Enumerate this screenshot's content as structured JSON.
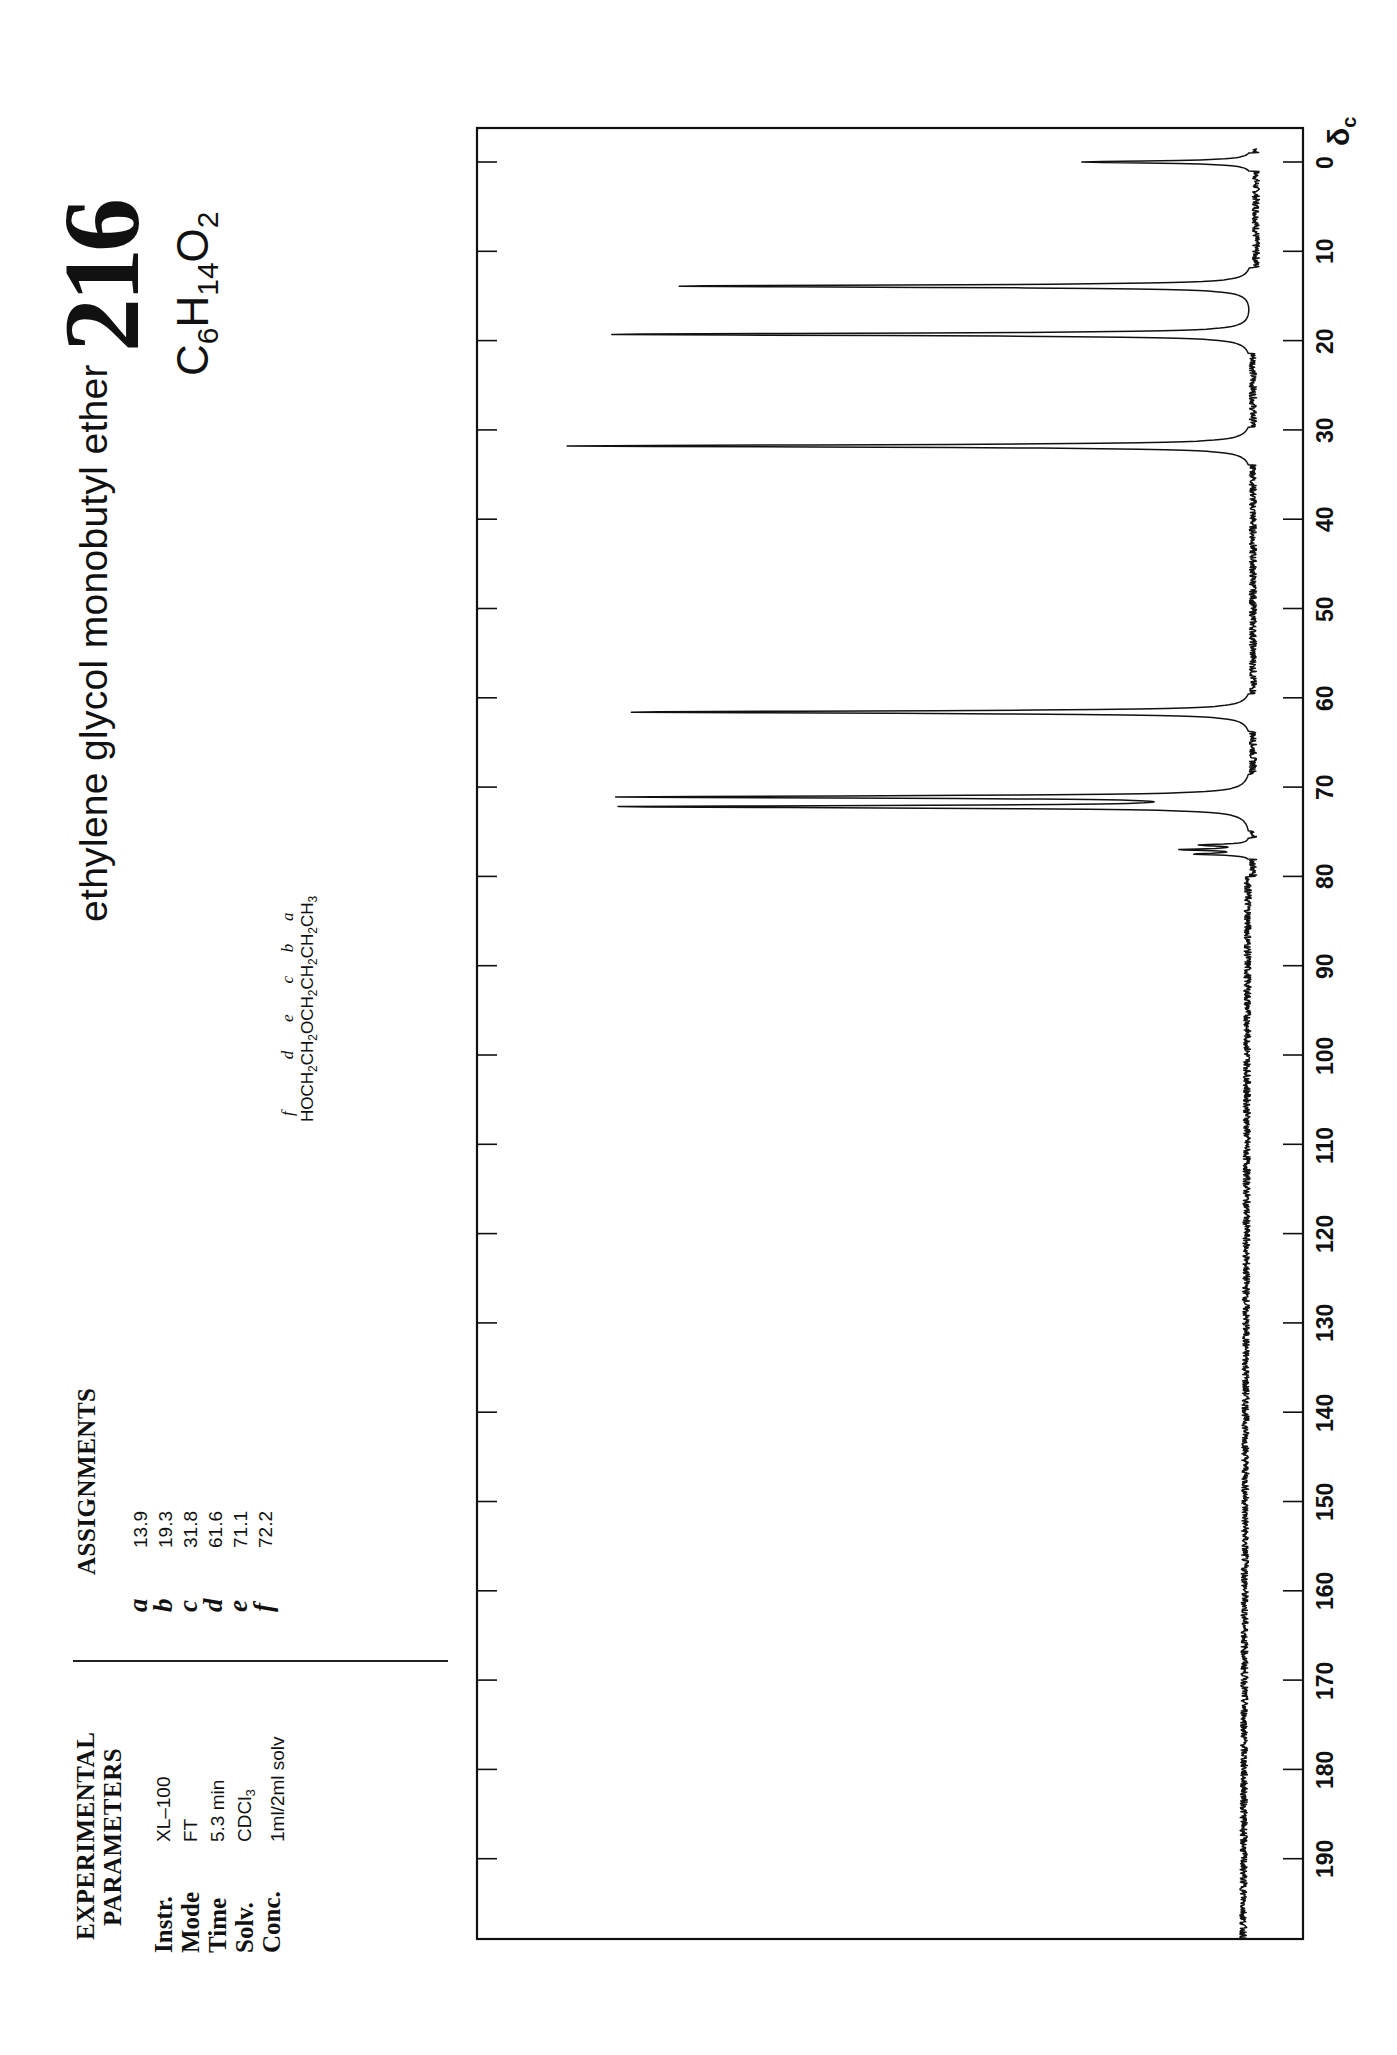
{
  "header": {
    "compound_name": "ethylene glycol monobutyl ether",
    "spectrum_number": "216",
    "formula": {
      "C": "C",
      "c_count": "6",
      "H": "H",
      "h_count": "14",
      "O": "O",
      "o_count": "2"
    }
  },
  "structure": {
    "segments": [
      {
        "text": "HOCH",
        "sub": "2",
        "label": "f"
      },
      {
        "text": "CH",
        "sub": "2",
        "label": "d"
      },
      {
        "text": "OCH",
        "sub": "2",
        "label": "e"
      },
      {
        "text": "CH",
        "sub": "2",
        "label": "c"
      },
      {
        "text": "CH",
        "sub": "2",
        "label": "b"
      },
      {
        "text": "CH",
        "sub": "3",
        "label": "a"
      }
    ]
  },
  "assignments": {
    "heading": "ASSIGNMENTS",
    "rows": [
      {
        "letter": "a",
        "value": "13.9"
      },
      {
        "letter": "b",
        "value": "19.3"
      },
      {
        "letter": "c",
        "value": "31.8"
      },
      {
        "letter": "d",
        "value": "61.6"
      },
      {
        "letter": "e",
        "value": "71.1"
      },
      {
        "letter": "f",
        "value": "72.2"
      }
    ]
  },
  "parameters": {
    "heading_line1": "EXPERIMENTAL",
    "heading_line2": "PARAMETERS",
    "rows": [
      {
        "label": "Instr.",
        "value": "XL–100",
        "sub": ""
      },
      {
        "label": "Mode",
        "value": "FT",
        "sub": ""
      },
      {
        "label": "Time",
        "value": "5.3 min",
        "sub": ""
      },
      {
        "label": "Solv.",
        "value": "CDCl",
        "sub": "3"
      },
      {
        "label": "Conc.",
        "value": "1ml/2ml solv",
        "sub": ""
      }
    ]
  },
  "axis": {
    "unit_symbol": "δ",
    "unit_sub": "c",
    "ticks": [
      "0",
      "10",
      "20",
      "30",
      "40",
      "50",
      "60",
      "70",
      "80",
      "90",
      "100",
      "110",
      "120",
      "130",
      "140",
      "150",
      "160",
      "170",
      "180",
      "190"
    ]
  },
  "colors": {
    "ink": "#111111",
    "paper": "#ffffff"
  },
  "chart_data": {
    "type": "line",
    "title": "ethylene glycol monobutyl ether",
    "subtitle": "216  C6H14O2",
    "xlabel": "δc (ppm)",
    "ylabel": "",
    "xlim": [
      0,
      200
    ],
    "x_direction": "increasing downward (rotated page)",
    "grid": false,
    "x_ticks": [
      0,
      10,
      20,
      30,
      40,
      50,
      60,
      70,
      80,
      90,
      100,
      110,
      120,
      130,
      140,
      150,
      160,
      170,
      180,
      190
    ],
    "peaks": [
      {
        "shift": 0.0,
        "relative_intensity": 0.25,
        "label": "TMS"
      },
      {
        "shift": 13.9,
        "relative_intensity": 0.85,
        "label": "a"
      },
      {
        "shift": 19.3,
        "relative_intensity": 0.95,
        "label": "b"
      },
      {
        "shift": 31.8,
        "relative_intensity": 1.0,
        "label": "c"
      },
      {
        "shift": 61.6,
        "relative_intensity": 0.92,
        "label": "d"
      },
      {
        "shift": 71.1,
        "relative_intensity": 0.91,
        "label": "e"
      },
      {
        "shift": 72.2,
        "relative_intensity": 0.92,
        "label": "f"
      },
      {
        "shift": 76.5,
        "relative_intensity": 0.07,
        "label": "CDCl3"
      },
      {
        "shift": 77.0,
        "relative_intensity": 0.1,
        "label": "CDCl3"
      },
      {
        "shift": 77.5,
        "relative_intensity": 0.08,
        "label": "CDCl3"
      }
    ]
  }
}
